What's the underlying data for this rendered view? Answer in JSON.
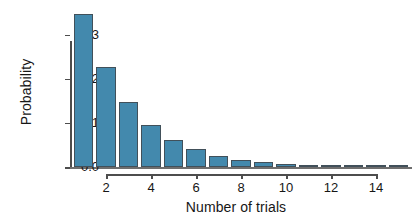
{
  "chart_data": {
    "type": "bar",
    "title": "",
    "xlabel": "Number of trials",
    "ylabel": "Probability",
    "categories": [
      1,
      2,
      3,
      4,
      5,
      6,
      7,
      8,
      9,
      10,
      11,
      12,
      13,
      14,
      15
    ],
    "values": [
      0.347,
      0.226,
      0.147,
      0.096,
      0.062,
      0.04,
      0.026,
      0.017,
      0.011,
      0.007,
      0.005,
      0.003,
      0.002,
      0.001,
      0.001
    ],
    "xlim": [
      0.4,
      15.6
    ],
    "ylim": [
      0.0,
      0.36
    ],
    "xticks": [
      2,
      4,
      6,
      8,
      10,
      12,
      14
    ],
    "xtick_labels": [
      "2",
      "4",
      "6",
      "8",
      "10",
      "12",
      "14"
    ],
    "yticks": [
      0.0,
      0.1,
      0.2,
      0.3
    ],
    "ytick_labels": [
      "0.0",
      "0.1",
      "0.2",
      "0.3"
    ],
    "grid": false,
    "legend": null,
    "series_name": "Geometric distribution",
    "bar_fill_color": "#4389ad",
    "bar_edge_color": "#41505a",
    "axis_color": "#4d4d4d",
    "background_color": "#ffffff"
  }
}
